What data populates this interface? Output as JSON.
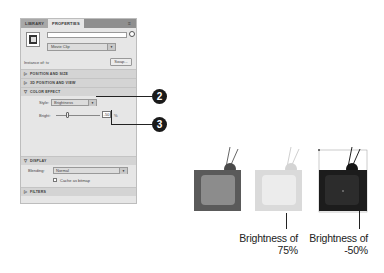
{
  "panel": {
    "tabs": [
      {
        "label": "LIBRARY",
        "active": false
      },
      {
        "label": "PROPERTIES",
        "active": true
      }
    ],
    "instance_name": {
      "value": "",
      "placeholder": ""
    },
    "symbol_type": "Movie Clip",
    "instance_of_label": "Instance of: tv",
    "swap_label": "Swap...",
    "sections": {
      "position_size": "POSITION AND SIZE",
      "position_view_3d": "3D POSITION AND VIEW",
      "color_effect": "COLOR EFFECT",
      "display": "DISPLAY",
      "filters": "FILTERS"
    },
    "color_effect": {
      "style_label": "Style:",
      "style_value": "Brightness",
      "bright_label": "Bright:",
      "bright_value": "-50",
      "bright_unit": "%"
    },
    "display": {
      "blending_label": "Blending:",
      "blending_value": "Normal",
      "cache_label": "Cache as bitmap",
      "cache_checked": false
    }
  },
  "callouts": [
    {
      "number": "2"
    },
    {
      "number": "3"
    }
  ],
  "examples": [
    {
      "caption_line1": "",
      "caption_line2": "",
      "body_color": "#5a5a5a",
      "screen_color": "#8c8c8c"
    },
    {
      "caption_line1": "Brightness of",
      "caption_line2": "75%",
      "body_color": "#dadada",
      "screen_color": "#ececec"
    },
    {
      "caption_line1": "Brightness of",
      "caption_line2": "-50%",
      "body_color": "#1c1c1c",
      "screen_color": "#2c2c2c"
    }
  ]
}
